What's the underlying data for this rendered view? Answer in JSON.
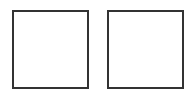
{
  "boxes": [
    {
      "id": "box-1",
      "label": "",
      "checked": false
    },
    {
      "id": "box-2",
      "label": "",
      "checked": false
    }
  ],
  "colors": {
    "background": "#ffffff",
    "border": "#333333"
  }
}
